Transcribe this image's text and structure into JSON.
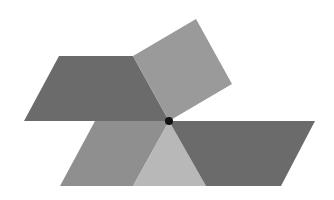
{
  "diagram": {
    "background": "#ffffff",
    "shapes": [
      {
        "id": "top-left-parallelogram",
        "type": "parallelogram",
        "fill": "#6b6b6b",
        "points": "59,56 133,56 169,121 24,121"
      },
      {
        "id": "tilted-square",
        "type": "square",
        "fill": "#9a9a9a",
        "points": "133,56 196,19 232,84 169,121"
      },
      {
        "id": "bottom-left-parallelogram",
        "type": "parallelogram",
        "fill": "#8f8f8f",
        "points": "95,121 169,121 133,186 60,186"
      },
      {
        "id": "center-triangle",
        "type": "triangle",
        "fill": "#b8b8b8",
        "points": "169,121 206,186 133,186"
      },
      {
        "id": "right-parallelogram",
        "type": "parallelogram",
        "fill": "#6b6b6b",
        "points": "169,121 315,121 281,186 206,186"
      }
    ],
    "center_point": {
      "cx": 169,
      "cy": 121,
      "r": 4,
      "fill": "#111111"
    }
  }
}
